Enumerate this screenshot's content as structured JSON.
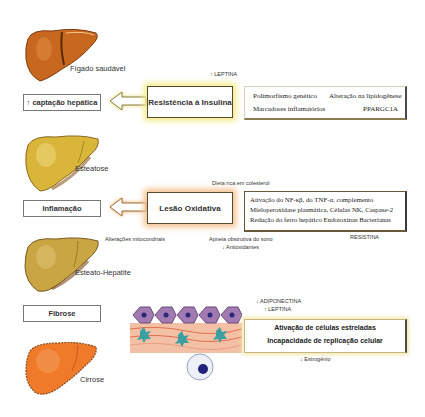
{
  "stages": [
    {
      "label": "Fígado saudável",
      "color": "#c8671e"
    },
    {
      "label": "Esteatose",
      "color": "#d9b53a"
    },
    {
      "label": "Esteato-Hepatite",
      "color": "#c9a544"
    },
    {
      "label": "Cirrose",
      "color": "#ee7a2a"
    }
  ],
  "left_boxes": [
    {
      "label": "↑ captação hepática"
    },
    {
      "label": "Inflamação"
    },
    {
      "label": "Fibrose"
    }
  ],
  "insulin": {
    "top_label": "↑ LEPTINA",
    "cause": "Resistência à Insulina",
    "details": [
      "Polimorfismo genético",
      "Alteração na lipidogênese",
      "Marcadores inflamatórios",
      "PPARGC1A"
    ],
    "glow_color": "#f3ec8a"
  },
  "oxidative": {
    "top_label": "Dieta rica em colesterol",
    "cause": "Lesão Oxidativa",
    "details": [
      "Ativação do NF-κβ, do TNF-α, complemento",
      "Mieloperoxidase plasmática, Células NK, Caspase-2",
      "Redução do ferro hepático Endotoxinas Bacterianas"
    ],
    "below_left": "Alterações mitocondriais",
    "below_mid_1": "Apneia obstrutiva do sono",
    "below_mid_2": "↓ Antioxidantes",
    "below_right": "RESISTINA",
    "glow_color": "#f2c08e"
  },
  "fibrosis": {
    "top_label_1": "↓ ADIPONECTINA",
    "top_label_2": "↑ LEPTINA",
    "details": [
      "Ativação de células estreladas",
      "Incapacidade de replicação celular"
    ],
    "bottom_label": "↓ Estrogênio",
    "glow_color": "#f3e8b0"
  }
}
